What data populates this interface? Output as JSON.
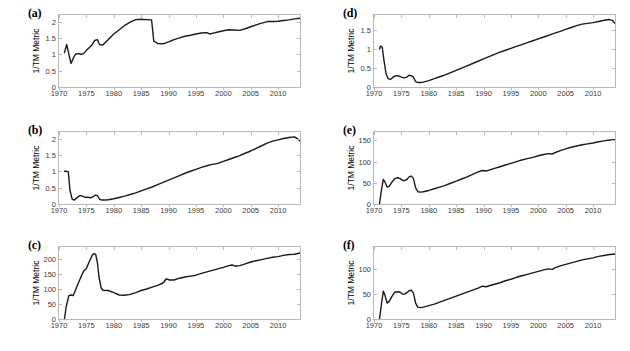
{
  "figure": {
    "ylabel": "1/TM Metric",
    "line_color": "#1a1a1a",
    "axis_color": "#b9b9b9",
    "background": "#ffffff"
  },
  "chart_data": [
    {
      "type": "line",
      "panel": "(a)",
      "title": "",
      "xlabel": "",
      "ylabel": "1/TM Metric",
      "xlim": [
        1970,
        2014
      ],
      "ylim": [
        0,
        2.2
      ],
      "xticks": [
        1970,
        1975,
        1980,
        1985,
        1990,
        1995,
        2000,
        2005,
        2010
      ],
      "yticks": [
        0,
        0.5,
        1,
        1.5,
        2
      ],
      "ytick_labels": [
        "0",
        "0.5",
        "1",
        "1.5",
        "2"
      ],
      "grid": false,
      "legend": "none",
      "x": [
        1971,
        1971.4,
        1971.8,
        1972.2,
        1972.6,
        1973,
        1973.5,
        1974,
        1974.5,
        1975,
        1975.5,
        1976,
        1976.5,
        1977,
        1977.4,
        1978,
        1979,
        1980,
        1981,
        1982,
        1983,
        1984,
        1985,
        1986,
        1986.6,
        1986.9,
        1987.3,
        1988,
        1989,
        1990,
        1991,
        1992,
        1993,
        1994,
        1995,
        1996,
        1997,
        1997.5,
        1998,
        1999,
        2000,
        2001,
        2002,
        2003,
        2004,
        2005,
        2006,
        2007,
        2008,
        2009,
        2010,
        2011,
        2012,
        2013,
        2014
      ],
      "y": [
        1.05,
        1.3,
        1.0,
        0.72,
        0.88,
        1.0,
        1.02,
        1.0,
        1.02,
        1.12,
        1.2,
        1.28,
        1.42,
        1.45,
        1.3,
        1.28,
        1.45,
        1.62,
        1.75,
        1.88,
        1.98,
        2.06,
        2.07,
        2.06,
        2.05,
        2.05,
        1.4,
        1.33,
        1.32,
        1.38,
        1.45,
        1.5,
        1.55,
        1.58,
        1.62,
        1.65,
        1.66,
        1.62,
        1.64,
        1.68,
        1.72,
        1.75,
        1.74,
        1.73,
        1.78,
        1.84,
        1.9,
        1.95,
        2.0,
        2.0,
        2.01,
        2.03,
        2.05,
        2.08,
        2.1
      ]
    },
    {
      "type": "line",
      "panel": "(b)",
      "title": "",
      "xlabel": "",
      "ylabel": "1/TM Metric",
      "xlim": [
        1970,
        2014
      ],
      "ylim": [
        0,
        2.2
      ],
      "xticks": [
        1970,
        1975,
        1980,
        1985,
        1990,
        1995,
        2000,
        2005,
        2010
      ],
      "yticks": [
        0,
        0.5,
        1,
        1.5,
        2
      ],
      "ytick_labels": [
        "0",
        "0.5",
        "1",
        "1.5",
        "2"
      ],
      "grid": false,
      "legend": "none",
      "x": [
        1971,
        1971.3,
        1971.7,
        1972,
        1972.4,
        1972.8,
        1973.2,
        1973.8,
        1974.3,
        1974.8,
        1975.2,
        1975.7,
        1976.2,
        1976.6,
        1977,
        1977.4,
        1977.8,
        1978.2,
        1979,
        1980,
        1981,
        1982,
        1983,
        1984,
        1985,
        1986,
        1987,
        1988,
        1989,
        1990,
        1991,
        1992,
        1993,
        1994,
        1995,
        1996,
        1997,
        1998,
        1999,
        2000,
        2001,
        2002,
        2003,
        2004,
        2005,
        2006,
        2007,
        2008,
        2009,
        2010,
        2011,
        2012,
        2013,
        2013.5,
        2014
      ],
      "y": [
        1.0,
        1.0,
        0.98,
        0.42,
        0.15,
        0.12,
        0.18,
        0.26,
        0.24,
        0.2,
        0.21,
        0.19,
        0.22,
        0.27,
        0.26,
        0.15,
        0.12,
        0.12,
        0.13,
        0.16,
        0.2,
        0.24,
        0.29,
        0.34,
        0.4,
        0.46,
        0.52,
        0.59,
        0.66,
        0.73,
        0.8,
        0.87,
        0.94,
        1.0,
        1.06,
        1.12,
        1.17,
        1.21,
        1.24,
        1.3,
        1.36,
        1.42,
        1.48,
        1.55,
        1.62,
        1.7,
        1.78,
        1.86,
        1.92,
        1.96,
        2.0,
        2.03,
        2.05,
        2.0,
        1.93
      ]
    },
    {
      "type": "line",
      "panel": "(c)",
      "title": "",
      "xlabel": "",
      "ylabel": "1/TM Metric",
      "xlim": [
        1970,
        2014
      ],
      "ylim": [
        0,
        240
      ],
      "xticks": [
        1970,
        1975,
        1980,
        1985,
        1990,
        1995,
        2000,
        2005,
        2010
      ],
      "yticks": [
        0,
        50,
        100,
        150,
        200
      ],
      "ytick_labels": [
        "0",
        "50",
        "100",
        "150",
        "200"
      ],
      "grid": false,
      "legend": "none",
      "x": [
        1971,
        1971.3,
        1971.8,
        1972.2,
        1972.6,
        1973,
        1973.5,
        1974,
        1974.5,
        1975,
        1975.5,
        1976,
        1976.3,
        1976.7,
        1977,
        1977.3,
        1977.7,
        1978,
        1979,
        1980,
        1981,
        1982,
        1983,
        1984,
        1985,
        1986,
        1987,
        1988,
        1989,
        1989.6,
        1990.2,
        1991,
        1992,
        1993,
        1994,
        1995,
        1996,
        1997,
        1998,
        1999,
        2000,
        2001,
        2001.6,
        2002.2,
        2003,
        2004,
        2005,
        2006,
        2007,
        2008,
        2009,
        2010,
        2011,
        2012,
        2013,
        2014
      ],
      "y": [
        0,
        40,
        78,
        80,
        78,
        96,
        118,
        140,
        160,
        168,
        190,
        210,
        218,
        215,
        190,
        140,
        103,
        96,
        95,
        88,
        80,
        79,
        82,
        88,
        95,
        100,
        106,
        112,
        120,
        134,
        130,
        130,
        136,
        140,
        143,
        146,
        152,
        157,
        162,
        167,
        172,
        178,
        180,
        176,
        178,
        184,
        190,
        194,
        198,
        202,
        206,
        208,
        212,
        215,
        216,
        220
      ]
    },
    {
      "type": "line",
      "panel": "(d)",
      "title": "",
      "xlabel": "",
      "ylabel": "1/TM Metric",
      "xlim": [
        1970,
        2014
      ],
      "ylim": [
        0,
        1.9
      ],
      "xticks": [
        1970,
        1975,
        1980,
        1985,
        1990,
        1995,
        2000,
        2005,
        2010
      ],
      "yticks": [
        0,
        0.5,
        1,
        1.5
      ],
      "ytick_labels": [
        "0",
        "0.5",
        "1",
        "1.5"
      ],
      "grid": false,
      "legend": "none",
      "x": [
        1971,
        1971.2,
        1971.5,
        1971.8,
        1972.2,
        1972.6,
        1973,
        1973.5,
        1974,
        1974.5,
        1975,
        1975.5,
        1976,
        1976.4,
        1976.8,
        1977.2,
        1977.6,
        1978,
        1978.5,
        1979,
        1980,
        1981,
        1982,
        1983,
        1984,
        1985,
        1986,
        1987,
        1988,
        1989,
        1990,
        1991,
        1992,
        1993,
        1994,
        1995,
        1996,
        1997,
        1998,
        1999,
        2000,
        2001,
        2002,
        2003,
        2004,
        2005,
        2006,
        2007,
        2008,
        2009,
        2010,
        2011,
        2012,
        2013,
        2013.5,
        2014
      ],
      "y": [
        1.0,
        1.08,
        1.05,
        0.72,
        0.35,
        0.22,
        0.2,
        0.26,
        0.3,
        0.29,
        0.26,
        0.24,
        0.26,
        0.31,
        0.3,
        0.26,
        0.14,
        0.12,
        0.12,
        0.13,
        0.17,
        0.22,
        0.27,
        0.32,
        0.38,
        0.44,
        0.5,
        0.56,
        0.62,
        0.68,
        0.74,
        0.8,
        0.86,
        0.92,
        0.97,
        1.02,
        1.07,
        1.12,
        1.17,
        1.22,
        1.27,
        1.32,
        1.37,
        1.42,
        1.47,
        1.52,
        1.57,
        1.62,
        1.66,
        1.68,
        1.7,
        1.73,
        1.76,
        1.78,
        1.76,
        1.68
      ]
    },
    {
      "type": "line",
      "panel": "(e)",
      "title": "",
      "xlabel": "",
      "ylabel": "1/TM Metric",
      "xlim": [
        1970,
        2014
      ],
      "ylim": [
        0,
        170
      ],
      "xticks": [
        1970,
        1975,
        1980,
        1985,
        1990,
        1995,
        2000,
        2005,
        2010
      ],
      "yticks": [
        0,
        50,
        100,
        150
      ],
      "ytick_labels": [
        "0",
        "50",
        "100",
        "150"
      ],
      "grid": false,
      "legend": "none",
      "x": [
        1971,
        1971.3,
        1971.7,
        1972,
        1972.4,
        1972.8,
        1973.3,
        1973.8,
        1974.3,
        1974.8,
        1975.2,
        1975.6,
        1976,
        1976.4,
        1976.8,
        1977.2,
        1977.6,
        1978,
        1978.5,
        1979,
        1980,
        1981,
        1982,
        1983,
        1984,
        1985,
        1986,
        1987,
        1988,
        1989,
        1989.8,
        1990.5,
        1991,
        1992,
        1993,
        1994,
        1995,
        1996,
        1997,
        1998,
        1999,
        2000,
        2001,
        2001.8,
        2002.5,
        2003,
        2004,
        2005,
        2006,
        2007,
        2008,
        2009,
        2010,
        2011,
        2012,
        2013,
        2014
      ],
      "y": [
        0,
        28,
        58,
        52,
        40,
        42,
        52,
        60,
        62,
        60,
        56,
        55,
        58,
        64,
        66,
        60,
        38,
        29,
        28,
        29,
        32,
        36,
        40,
        44,
        49,
        54,
        59,
        64,
        70,
        76,
        79,
        78,
        80,
        84,
        88,
        92,
        96,
        100,
        104,
        107,
        110,
        114,
        117,
        119,
        118,
        121,
        126,
        130,
        134,
        137,
        140,
        142,
        144,
        147,
        149,
        151,
        152
      ]
    },
    {
      "type": "line",
      "panel": "(f)",
      "title": "",
      "xlabel": "",
      "ylabel": "1/TM Metric",
      "xlim": [
        1970,
        2014
      ],
      "ylim": [
        0,
        145
      ],
      "xticks": [
        1970,
        1975,
        1980,
        1985,
        1990,
        1995,
        2000,
        2005,
        2010
      ],
      "yticks": [
        0,
        50,
        100
      ],
      "ytick_labels": [
        "0",
        "50",
        "100"
      ],
      "grid": false,
      "legend": "none",
      "x": [
        1971,
        1971.3,
        1971.7,
        1972,
        1972.4,
        1972.8,
        1973.3,
        1973.8,
        1974.3,
        1974.8,
        1975.2,
        1975.6,
        1976,
        1976.4,
        1976.8,
        1977.2,
        1977.6,
        1978,
        1978.5,
        1979,
        1980,
        1981,
        1982,
        1983,
        1984,
        1985,
        1986,
        1987,
        1988,
        1989,
        1989.8,
        1990.5,
        1991,
        1992,
        1993,
        1994,
        1995,
        1996,
        1997,
        1998,
        1999,
        2000,
        2001,
        2001.8,
        2002.6,
        2003,
        2004,
        2005,
        2006,
        2007,
        2008,
        2009,
        2010,
        2011,
        2012,
        2013,
        2014
      ],
      "y": [
        0,
        25,
        56,
        48,
        32,
        36,
        46,
        54,
        55,
        54,
        50,
        50,
        53,
        57,
        58,
        52,
        32,
        24,
        23,
        24,
        27,
        30,
        34,
        38,
        42,
        46,
        50,
        54,
        58,
        62,
        66,
        65,
        67,
        70,
        73,
        77,
        80,
        84,
        87,
        90,
        93,
        96,
        99,
        101,
        100,
        103,
        107,
        110,
        113,
        116,
        119,
        121,
        123,
        126,
        128,
        130,
        131
      ]
    }
  ]
}
